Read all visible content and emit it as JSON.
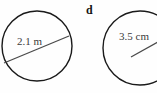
{
  "figure": {
    "kind": "geometry-diagram",
    "width": 157,
    "height": 93,
    "background_color": "#fefefe",
    "stroke_color": "#1a1a1a",
    "measure_line_color": "#4a4a4a",
    "part_label": {
      "text": "d",
      "style": "bold-serif",
      "color": "#141414"
    },
    "shapes": [
      {
        "name": "left-circle",
        "type": "circle",
        "center_x": 37,
        "center_y": 46,
        "radius": 35,
        "measure": {
          "type": "diameter",
          "label": "2.1 m",
          "value": 2.1,
          "unit": "m",
          "x1": 4,
          "y1": 63,
          "x2": 69,
          "y2": 36
        }
      },
      {
        "name": "right-circle",
        "type": "circle",
        "center_x": 140,
        "center_y": 48,
        "radius": 37,
        "clipped": "right-edge",
        "measure": {
          "type": "radius",
          "label": "3.5 cm",
          "value": 3.5,
          "unit": "cm",
          "x1": 131,
          "y1": 57,
          "x2": 157,
          "y2": 43
        }
      }
    ]
  }
}
